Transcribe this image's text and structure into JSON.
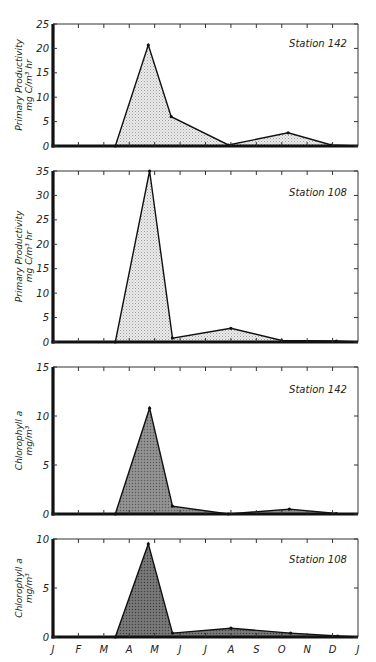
{
  "figure": {
    "months": [
      "J",
      "F",
      "M",
      "A",
      "M",
      "J",
      "J",
      "A",
      "S",
      "O",
      "N",
      "D",
      "J"
    ],
    "background": "#ffffff",
    "line_color": "#111111"
  },
  "chart_data": [
    {
      "type": "area",
      "title": "Station 142",
      "ylabel": "Primary Productivity mg C/m³ hr",
      "ylabel_line1": "Primary Productivity",
      "ylabel_line2": "mg C/m³ hr",
      "xlabel": "",
      "x_unit": "month index (0 = Jan 1, 12 = Jan 1 next year)",
      "ylim": [
        0,
        25
      ],
      "yticks": [
        0,
        5,
        10,
        15,
        20,
        25
      ],
      "x": [
        0,
        2.45,
        3.75,
        4.65,
        6.9,
        9.25,
        10.95,
        12
      ],
      "y": [
        0,
        0,
        20.7,
        6.0,
        0.2,
        2.7,
        0.2,
        0
      ],
      "fill": "#e4e4e4",
      "fill_style": "stippled-light",
      "grid": false
    },
    {
      "type": "area",
      "title": "Station 108",
      "ylabel": "Primary Productivity mg C/m³ hr",
      "ylabel_line1": "Primary Productivity",
      "ylabel_line2": "mg C/m³ hr",
      "xlabel": "",
      "x_unit": "month index",
      "ylim": [
        0,
        35
      ],
      "yticks": [
        0,
        5,
        10,
        15,
        20,
        25,
        30,
        35
      ],
      "x": [
        0,
        2.45,
        3.8,
        4.7,
        7.0,
        9.0,
        11.15,
        12
      ],
      "y": [
        0,
        0,
        35,
        0.8,
        2.8,
        0.3,
        0.2,
        0
      ],
      "fill": "#e4e4e4",
      "fill_style": "stippled-light",
      "grid": false
    },
    {
      "type": "area",
      "title": "Station 142",
      "ylabel": "Chlorophyll a mg/m³",
      "ylabel_line1": "Chlorophyll a",
      "ylabel_line2": "mg/m³",
      "xlabel": "",
      "x_unit": "month index",
      "ylim": [
        0,
        15
      ],
      "yticks": [
        0,
        5,
        10,
        15
      ],
      "x": [
        0,
        2.45,
        3.8,
        4.7,
        6.9,
        9.3,
        11.15,
        12
      ],
      "y": [
        0,
        0,
        10.8,
        0.8,
        0,
        0.5,
        0.05,
        0
      ],
      "fill": "#8a8a8a",
      "fill_style": "stippled-dark",
      "grid": false
    },
    {
      "type": "area",
      "title": "Station 108",
      "ylabel": "Chlorophyll a mg/m³",
      "ylabel_line1": "Chlorophyll a",
      "ylabel_line2": "mg/m³",
      "xlabel": "Month",
      "x_unit": "month index",
      "ylim": [
        0,
        10
      ],
      "yticks": [
        0,
        5,
        10
      ],
      "xticklabels": [
        "J",
        "F",
        "M",
        "A",
        "M",
        "J",
        "J",
        "A",
        "S",
        "O",
        "N",
        "D",
        "J"
      ],
      "x": [
        0,
        2.45,
        3.75,
        4.7,
        7.0,
        9.35,
        11.2,
        12
      ],
      "y": [
        0,
        0,
        9.5,
        0.4,
        0.9,
        0.4,
        0.1,
        0
      ],
      "fill": "#6e6e6e",
      "fill_style": "stippled-dark",
      "grid": false
    }
  ]
}
